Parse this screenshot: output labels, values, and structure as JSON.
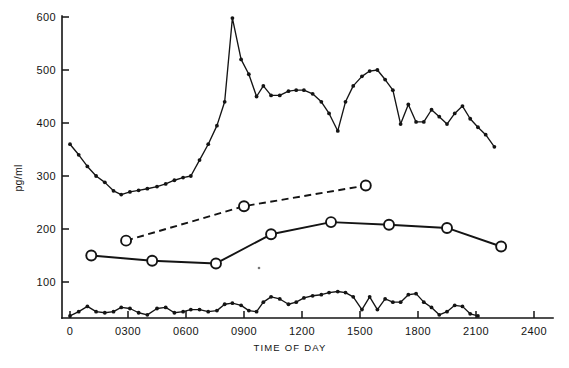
{
  "figure": {
    "background_color": "#ffffff",
    "ink_color": "#141414"
  },
  "chart_data": {
    "type": "line",
    "title": "",
    "subtitle": "",
    "xlabel": "TIME OF DAY",
    "ylabel": "pg/ml",
    "grid": false,
    "legend_position": "none",
    "xlim": [
      0,
      2400
    ],
    "ylim": [
      32,
      600
    ],
    "xticks": [
      0,
      300,
      600,
      900,
      1200,
      1500,
      1800,
      2100,
      2400
    ],
    "xtick_labels": [
      "0",
      "0300",
      "0600",
      "0900",
      "1200",
      "1500",
      "1800",
      "2100",
      "2400"
    ],
    "yticks": [
      100,
      200,
      300,
      400,
      500,
      600
    ],
    "ytick_labels": [
      "100",
      "200",
      "300",
      "400",
      "500",
      "600"
    ],
    "series": [
      {
        "name": "upper-frequent-sampling-series",
        "marker": "filled-circle",
        "line_style": "solid",
        "line_weight": "thin",
        "points": [
          [
            0,
            360
          ],
          [
            45,
            340
          ],
          [
            90,
            318
          ],
          [
            135,
            300
          ],
          [
            180,
            288
          ],
          [
            225,
            272
          ],
          [
            265,
            265
          ],
          [
            310,
            270
          ],
          [
            355,
            273
          ],
          [
            400,
            276
          ],
          [
            450,
            280
          ],
          [
            495,
            285
          ],
          [
            540,
            292
          ],
          [
            585,
            297
          ],
          [
            625,
            300
          ],
          [
            670,
            330
          ],
          [
            715,
            360
          ],
          [
            760,
            395
          ],
          [
            800,
            440
          ],
          [
            840,
            598
          ],
          [
            885,
            520
          ],
          [
            925,
            492
          ],
          [
            965,
            450
          ],
          [
            1000,
            470
          ],
          [
            1040,
            452
          ],
          [
            1085,
            452
          ],
          [
            1130,
            460
          ],
          [
            1170,
            462
          ],
          [
            1210,
            462
          ],
          [
            1255,
            455
          ],
          [
            1300,
            440
          ],
          [
            1340,
            418
          ],
          [
            1385,
            385
          ],
          [
            1425,
            440
          ],
          [
            1465,
            470
          ],
          [
            1510,
            488
          ],
          [
            1550,
            498
          ],
          [
            1590,
            500
          ],
          [
            1630,
            482
          ],
          [
            1670,
            462
          ],
          [
            1710,
            398
          ],
          [
            1750,
            435
          ],
          [
            1790,
            402
          ],
          [
            1830,
            402
          ],
          [
            1870,
            425
          ],
          [
            1910,
            412
          ],
          [
            1950,
            398
          ],
          [
            1990,
            418
          ],
          [
            2030,
            432
          ],
          [
            2070,
            408
          ],
          [
            2110,
            392
          ],
          [
            2150,
            378
          ],
          [
            2195,
            355
          ]
        ]
      },
      {
        "name": "middle-solid-open-circle-series",
        "marker": "open-circle",
        "line_style": "solid",
        "line_weight": "thick",
        "points": [
          [
            110,
            150
          ],
          [
            425,
            140
          ],
          [
            755,
            135
          ],
          [
            1040,
            190
          ],
          [
            1350,
            213
          ],
          [
            1650,
            208
          ],
          [
            1950,
            202
          ],
          [
            2230,
            167
          ]
        ]
      },
      {
        "name": "upper-dashed-open-circle-series",
        "marker": "open-circle",
        "line_style": "dashed",
        "line_weight": "thick",
        "points": [
          [
            290,
            178
          ],
          [
            900,
            243
          ],
          [
            1530,
            282
          ]
        ]
      },
      {
        "name": "lower-frequent-sampling-series",
        "marker": "filled-circle",
        "line_style": "solid",
        "line_weight": "thin",
        "points": [
          [
            0,
            36
          ],
          [
            45,
            44
          ],
          [
            90,
            54
          ],
          [
            135,
            44
          ],
          [
            180,
            42
          ],
          [
            225,
            44
          ],
          [
            265,
            52
          ],
          [
            310,
            50
          ],
          [
            355,
            42
          ],
          [
            400,
            38
          ],
          [
            450,
            50
          ],
          [
            495,
            52
          ],
          [
            540,
            42
          ],
          [
            585,
            44
          ],
          [
            625,
            48
          ],
          [
            670,
            48
          ],
          [
            715,
            44
          ],
          [
            760,
            46
          ],
          [
            800,
            58
          ],
          [
            840,
            60
          ],
          [
            885,
            56
          ],
          [
            925,
            46
          ],
          [
            965,
            44
          ],
          [
            1000,
            62
          ],
          [
            1040,
            72
          ],
          [
            1085,
            68
          ],
          [
            1130,
            58
          ],
          [
            1170,
            62
          ],
          [
            1210,
            70
          ],
          [
            1255,
            74
          ],
          [
            1300,
            76
          ],
          [
            1340,
            80
          ],
          [
            1385,
            82
          ],
          [
            1425,
            80
          ],
          [
            1465,
            72
          ],
          [
            1510,
            48
          ],
          [
            1550,
            72
          ],
          [
            1590,
            48
          ],
          [
            1630,
            68
          ],
          [
            1670,
            62
          ],
          [
            1710,
            62
          ],
          [
            1750,
            76
          ],
          [
            1790,
            78
          ],
          [
            1830,
            62
          ],
          [
            1870,
            52
          ],
          [
            1910,
            38
          ],
          [
            1950,
            44
          ],
          [
            1990,
            56
          ],
          [
            2030,
            54
          ],
          [
            2070,
            40
          ],
          [
            2110,
            36
          ]
        ]
      }
    ]
  }
}
